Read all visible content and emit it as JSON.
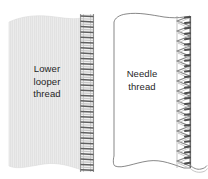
{
  "figure": {
    "name": "serger-stitch-diagram",
    "background_color": "#ffffff"
  },
  "panels": [
    {
      "id": "left-panel",
      "label_lines": [
        "Lower",
        "looper",
        "thread"
      ],
      "label_full": "Lower looper thread",
      "fabric_fill": "#ebebeb",
      "fabric_texture": "vertical-stripes",
      "fabric_outline": "#d8d8d8",
      "stitch_type": "ladder-rungs",
      "stitch_color": "#6f6f6f",
      "stitch_shadow_color": "#b9b9b9",
      "stitch_count": 30,
      "text_color": "#1f1f1f"
    },
    {
      "id": "right-panel",
      "label_lines": [
        "Needle",
        "thread"
      ],
      "label_full": "Needle thread",
      "fabric_fill": "#ffffff",
      "fabric_texture": "none",
      "fabric_outline": "#4a4a4a",
      "stitch_type": "zigzag-chevrons",
      "stitch_color": "#7a7a7a",
      "stitch_shadow_color": "#c2c2c2",
      "stitch_count": 28,
      "thread_tail": true,
      "text_color": "#1f1f1f"
    }
  ]
}
